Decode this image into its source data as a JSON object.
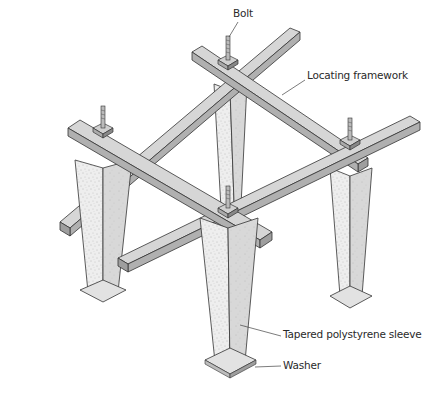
{
  "diagram": {
    "labels": {
      "bolt": "Bolt",
      "locating_framework": "Locating framework",
      "sleeve": "Tapered polystyrene sleeve",
      "washer": "Washer"
    },
    "colors": {
      "timber_top": "#d9d9d9",
      "timber_side": "#b4b4b4",
      "timber_end": "#9e9e9e",
      "sleeve_light": "#ececec",
      "sleeve_dark": "#d2d2d2",
      "outline": "#333333",
      "background": "#ffffff"
    },
    "components": [
      "Bolt",
      "Locating framework",
      "Tapered polystyrene sleeve",
      "Washer"
    ],
    "post_count": 4,
    "bolt_count": 4
  }
}
